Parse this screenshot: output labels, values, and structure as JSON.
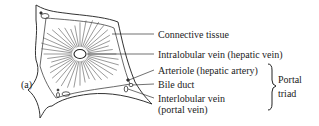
{
  "figure": {
    "panel_label": "(a)",
    "labels": {
      "connective_tissue": "Connective tissue",
      "intralobular_vein": "Intralobular vein (hepatic vein)",
      "arteriole": "Arteriole (hepatic artery)",
      "bile_duct": "Bile duct",
      "interlobular_vein_line1": "Interlobular vein",
      "interlobular_vein_line2": "(portal vein)"
    },
    "group_label_line1": "Portal",
    "group_label_line2": "triad"
  }
}
